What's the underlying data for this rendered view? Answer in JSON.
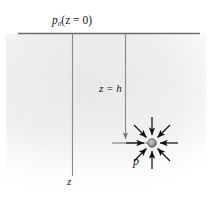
{
  "figure": {
    "background_color": "#ffffff",
    "shade_color": "#ebebeb",
    "line_color": "#7a7a7a",
    "arrow_color": "#1a1a1a",
    "text_color": "#1a1a1a",
    "width": 213,
    "height": 210
  },
  "labels": {
    "surface_pressure": "p",
    "surface_pressure_sub": "0",
    "surface_pressure_arg": "(z = 0)",
    "depth_marker": "z = h",
    "point_pressure": "p",
    "axis_z": "z"
  },
  "geometry": {
    "surface_line": {
      "x1": 18,
      "y1": 33,
      "x2": 200,
      "y2": 33
    },
    "z_axis_line": {
      "x1": 72,
      "y1": 33,
      "x2": 72,
      "y2": 175
    },
    "depth_line": {
      "x1": 125,
      "y1": 33,
      "x2": 125,
      "y2": 142
    },
    "tick_line": {
      "x1": 112,
      "y1": 143,
      "x2": 148,
      "y2": 143
    },
    "point": {
      "cx": 152,
      "cy": 143,
      "r": 4.2
    },
    "arrow_count": 8,
    "arrow_length": 23,
    "shade_rect": {
      "x": 8,
      "y": 34,
      "w": 196,
      "h": 150
    }
  }
}
